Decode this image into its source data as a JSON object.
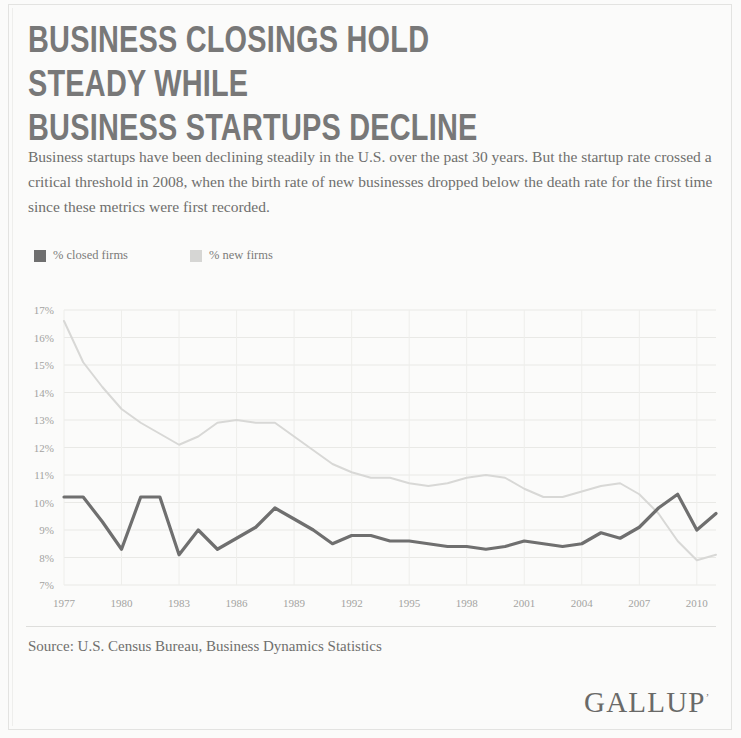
{
  "title": "BUSINESS CLOSINGS HOLD STEADY WHILE\nBUSINESS STARTUPS DECLINE",
  "subtitle": "Business startups have been declining steadily in the U.S. over the past 30 years. But the startup rate crossed a critical threshold in 2008, when the birth rate of new businesses dropped below the death rate for the first time since these metrics were first recorded.",
  "source": "Source: U.S. Census Bureau, Business Dynamics Statistics",
  "brand": {
    "name": "GALLUP",
    "trademark": "’"
  },
  "legend": [
    {
      "label": "% closed firms",
      "color": "#6f6f6f",
      "swatch": "legend-swatch-closed"
    },
    {
      "label": "% new firms",
      "color": "#d6d6d4",
      "swatch": "legend-swatch-new"
    }
  ],
  "colors": {
    "closed_firms": "#6f6f6f",
    "new_firms": "#d8d8d6",
    "grid": "#e9e9e6",
    "axis_text": "#a3a3a1",
    "title_text": "#787878",
    "body_text": "#6f6f6d",
    "page_background": "#fbfbfa"
  },
  "chart_data": {
    "type": "line",
    "title": "BUSINESS CLOSINGS HOLD STEADY WHILE BUSINESS STARTUPS DECLINE",
    "xlabel": "",
    "ylabel": "",
    "xlim": [
      1977,
      2011
    ],
    "ylim": [
      7,
      17
    ],
    "grid": true,
    "legend_position": "top-left",
    "y_tick_labels": [
      "17%",
      "16%",
      "15%",
      "14%",
      "13%",
      "12%",
      "11%",
      "10%",
      "9%",
      "8%",
      "7%"
    ],
    "y_ticks": [
      17,
      16,
      15,
      14,
      13,
      12,
      11,
      10,
      9,
      8,
      7
    ],
    "x_tick_labels": [
      "1977",
      "1980",
      "1983",
      "1986",
      "1989",
      "1992",
      "1995",
      "1998",
      "2001",
      "2004",
      "2007",
      "2010"
    ],
    "x_ticks": [
      1977,
      1980,
      1983,
      1986,
      1989,
      1992,
      1995,
      1998,
      2001,
      2004,
      2007,
      2010
    ],
    "x": [
      1977,
      1978,
      1979,
      1980,
      1981,
      1982,
      1983,
      1984,
      1985,
      1986,
      1987,
      1988,
      1989,
      1990,
      1991,
      1992,
      1993,
      1994,
      1995,
      1996,
      1997,
      1998,
      1999,
      2000,
      2001,
      2002,
      2003,
      2004,
      2005,
      2006,
      2007,
      2008,
      2009,
      2010,
      2011
    ],
    "series": [
      {
        "name": "% new firms",
        "color": "#d8d8d6",
        "values": [
          16.6,
          15.1,
          14.2,
          13.4,
          12.9,
          12.5,
          12.1,
          12.4,
          12.9,
          13.0,
          12.9,
          12.9,
          12.4,
          11.9,
          11.4,
          11.1,
          10.9,
          10.9,
          10.7,
          10.6,
          10.7,
          10.9,
          11.0,
          10.9,
          10.5,
          10.2,
          10.2,
          10.4,
          10.6,
          10.7,
          10.3,
          9.6,
          8.6,
          7.9,
          8.1
        ]
      },
      {
        "name": "% closed firms",
        "color": "#6f6f6f",
        "values": [
          10.2,
          10.2,
          9.3,
          8.3,
          10.2,
          10.2,
          8.1,
          9.0,
          8.3,
          8.7,
          9.1,
          9.8,
          9.4,
          9.0,
          8.5,
          8.8,
          8.8,
          8.6,
          8.6,
          8.5,
          8.4,
          8.4,
          8.3,
          8.4,
          8.6,
          8.5,
          8.4,
          8.5,
          8.9,
          8.7,
          9.1,
          9.8,
          10.3,
          9.0,
          9.6
        ]
      }
    ],
    "annotations": [
      {
        "text": "Birth rate of new businesses drops below death rate",
        "year": 2008
      }
    ]
  }
}
